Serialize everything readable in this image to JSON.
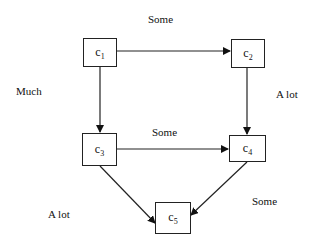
{
  "nodes": [
    {
      "id": "c1",
      "base": "c",
      "sub": "1"
    },
    {
      "id": "c2",
      "base": "c",
      "sub": "2"
    },
    {
      "id": "c3",
      "base": "c",
      "sub": "3"
    },
    {
      "id": "c4",
      "base": "c",
      "sub": "4"
    },
    {
      "id": "c5",
      "base": "c",
      "sub": "5"
    }
  ],
  "edges": [
    {
      "from": "c1",
      "to": "c2",
      "label": "Some"
    },
    {
      "from": "c1",
      "to": "c3",
      "label": "Much"
    },
    {
      "from": "c2",
      "to": "c4",
      "label": "A lot"
    },
    {
      "from": "c3",
      "to": "c4",
      "label": "Some"
    },
    {
      "from": "c3",
      "to": "c5",
      "label": "A lot"
    },
    {
      "from": "c4",
      "to": "c5",
      "label": "Some"
    }
  ]
}
